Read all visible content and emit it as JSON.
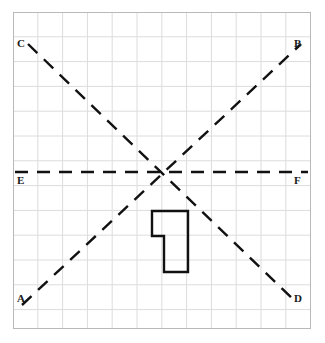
{
  "figure": {
    "name": "coordinate-grid-with-three-dashed-lines-and-polygon",
    "width": 325,
    "height": 343,
    "background_color": "#ffffff"
  },
  "grid": {
    "border_color": "#b9b9b9",
    "line_color": "#dcdcdc",
    "cell_size": 24.8,
    "x_start": 13,
    "y_start": 12,
    "x_end": 311,
    "y_end": 329,
    "columns": 12,
    "rows": 13
  },
  "center_point": {
    "label": "intersection",
    "x": 163,
    "y": 172
  },
  "lines": [
    {
      "id": "line-ab",
      "name": "diagonal-line-a-b",
      "from_label": "A",
      "to_label": "B",
      "x1": 22,
      "y1": 305,
      "x2": 301,
      "y2": 44,
      "color": "#111111",
      "stroke_width": 2.4,
      "dash": "13 9"
    },
    {
      "id": "line-cd",
      "name": "diagonal-line-c-d",
      "from_label": "C",
      "to_label": "D",
      "x1": 28,
      "y1": 44,
      "x2": 297,
      "y2": 303,
      "color": "#111111",
      "stroke_width": 2.4,
      "dash": "13 9"
    },
    {
      "id": "line-ef",
      "name": "horizontal-line-e-f",
      "from_label": "E",
      "to_label": "F",
      "x1": 15,
      "y1": 172,
      "x2": 308,
      "y2": 172,
      "color": "#111111",
      "stroke_width": 2.4,
      "dash": "13 9"
    }
  ],
  "labels": [
    {
      "id": "label-c",
      "text": "C",
      "x": 17,
      "y": 38,
      "name": "point-label-c"
    },
    {
      "id": "label-b",
      "text": "B",
      "x": 294,
      "y": 38,
      "name": "point-label-b"
    },
    {
      "id": "label-e",
      "text": "E",
      "x": 17,
      "y": 175,
      "name": "point-label-e"
    },
    {
      "id": "label-f",
      "text": "F",
      "x": 294,
      "y": 175,
      "name": "point-label-f"
    },
    {
      "id": "label-a",
      "text": "A",
      "x": 17,
      "y": 293,
      "name": "point-label-a"
    },
    {
      "id": "label-d",
      "text": "D",
      "x": 294,
      "y": 293,
      "name": "point-label-d"
    }
  ],
  "polygon": {
    "name": "flag-shaped-polygon",
    "points": "152,211 188,211 188,272 164,272 164,236 152,236",
    "stroke_color": "#111111",
    "stroke_width": 2.4,
    "fill": "none"
  }
}
